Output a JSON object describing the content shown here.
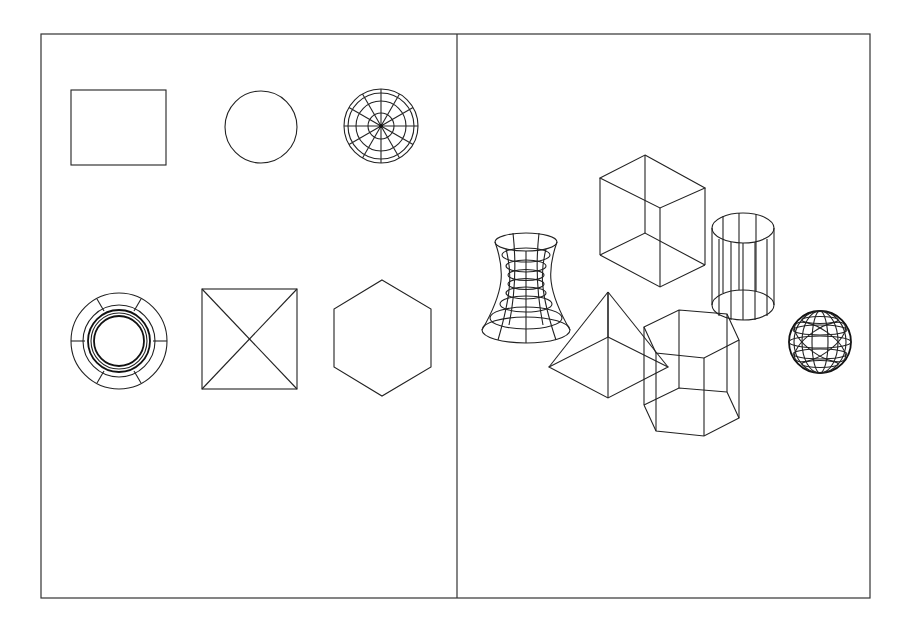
{
  "figure": {
    "colors": {
      "line": "#222222",
      "background": "#ffffff",
      "frame": "#333333"
    },
    "left_panel": {
      "shapes": [
        "rectangle",
        "circle",
        "sphere-top-view",
        "hyperboloid-top-view",
        "pyramid-top-view",
        "hexagonal-prism-top-view"
      ]
    },
    "right_panel": {
      "shapes": [
        "hyperboloid",
        "box",
        "cylinder",
        "pyramid",
        "hexagonal-prism",
        "sphere"
      ]
    }
  }
}
